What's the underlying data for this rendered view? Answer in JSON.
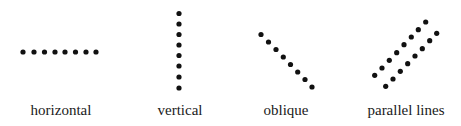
{
  "figure": {
    "dot_color": "#111111",
    "dot_radius": 2.6,
    "panels": [
      {
        "id": "horizontal",
        "label": "horizontal",
        "label_x": 61,
        "label_y": 115,
        "lines": [
          [
            [
              23,
              52
            ],
            [
              34,
              52
            ],
            [
              44.5,
              52
            ],
            [
              55,
              52
            ],
            [
              65,
              52
            ],
            [
              75.5,
              52
            ],
            [
              86,
              52
            ],
            [
              96,
              52
            ]
          ]
        ]
      },
      {
        "id": "vertical",
        "label": "vertical",
        "label_x": 180,
        "label_y": 115,
        "lines": [
          [
            [
              179,
              13.5
            ],
            [
              179,
              24
            ],
            [
              179,
              34.5
            ],
            [
              179,
              45
            ],
            [
              179,
              55.5
            ],
            [
              179,
              66
            ],
            [
              179,
              77
            ],
            [
              179,
              88
            ]
          ]
        ]
      },
      {
        "id": "oblique",
        "label": "oblique",
        "label_x": 286,
        "label_y": 115,
        "lines": [
          [
            [
              261,
              34.5
            ],
            [
              268.5,
              42
            ],
            [
              276,
              49.5
            ],
            [
              283.3,
              57
            ],
            [
              290.5,
              64.5
            ],
            [
              297.7,
              72
            ],
            [
              305,
              79.5
            ],
            [
              312,
              87
            ]
          ]
        ]
      },
      {
        "id": "parallel-lines",
        "label": "parallel lines",
        "label_x": 406,
        "label_y": 115,
        "lines": [
          [
            [
              374.7,
              75.3
            ],
            [
              382,
              68
            ],
            [
              389.3,
              60.3
            ],
            [
              396.7,
              52.7
            ],
            [
              404,
              44.7
            ],
            [
              411.3,
              37
            ],
            [
              418.3,
              29.7
            ],
            [
              425.7,
              22
            ]
          ],
          [
            [
              385.7,
              86.3
            ],
            [
              393,
              79
            ],
            [
              400.3,
              71.3
            ],
            [
              407.7,
              63.7
            ],
            [
              415,
              56
            ],
            [
              422.3,
              48.7
            ],
            [
              429.7,
              40.7
            ],
            [
              436.7,
              33.3
            ]
          ]
        ]
      }
    ]
  }
}
